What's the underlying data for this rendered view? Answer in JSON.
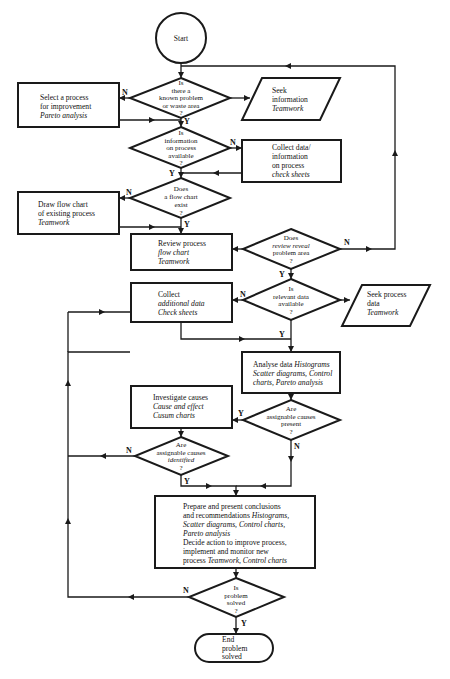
{
  "diagram": {
    "type": "flowchart",
    "nodes": {
      "start": {
        "text": "Start"
      },
      "d1": {
        "l1": "Is",
        "l2": "there a",
        "l3": "known problem",
        "l4": "or waste area",
        "q": "?"
      },
      "select": {
        "l1": "Select a process",
        "l2": "for improvement",
        "tool": "Pareto analysis"
      },
      "seek_info": {
        "l1": "Seek",
        "l2": "information",
        "tool": "Teamwork"
      },
      "d2": {
        "l1": "Is",
        "l2": "information",
        "l3": "on process",
        "l4": "available",
        "q": "?"
      },
      "collect": {
        "l1": "Collect data/",
        "l2": "information",
        "l3": "on process",
        "tool": "check sheets"
      },
      "d3": {
        "l1": "Does",
        "l2": "a flow chart",
        "l3": "exist",
        "q": "?"
      },
      "draw": {
        "l1": "Draw flow chart",
        "l2": "of existing process",
        "tool": "Teamwork"
      },
      "review": {
        "l1": "Review process",
        "l2": "flow chart",
        "tool": "Teamwork"
      },
      "d4": {
        "l1": "Does",
        "l2": "review reveal",
        "l3": "problem area",
        "q": "?"
      },
      "collect_add": {
        "l1": "Collect",
        "l2": "additional data",
        "tool": "Check sheets"
      },
      "d5": {
        "l1": "Is",
        "l2": "relevant data",
        "l3": "available",
        "q": "?"
      },
      "seek_proc": {
        "l1": "Seek process",
        "l2": "data",
        "tool": "Teamwork"
      },
      "analyse": {
        "l1a": "Analyse data ",
        "l1b": "Histograms",
        "l2": "Scatter diagrams, Control",
        "l3": "charts, Pareto analysis"
      },
      "investigate": {
        "l1": "Investigate causes",
        "l2": "Cause and effect",
        "l3": "Cusum charts"
      },
      "d6": {
        "l1": "Are",
        "l2": "assignable causes",
        "l3": "present",
        "q": "?"
      },
      "d7": {
        "l1": "Are",
        "l2": "assignable causes",
        "l3": "identified",
        "q": "?"
      },
      "prepare": {
        "l1": "Prepare and present conclusions",
        "l2a": "and recommendations ",
        "l2b": "Histograms,",
        "l3": "Scatter diagrams, Control charts,",
        "l4": "Pareto analysis",
        "l5": "Decide action to improve process,",
        "l6": "implement and monitor new",
        "l7a": "process ",
        "l7b": "Teamwork, Control charts"
      },
      "d8": {
        "l1": "Is",
        "l2": "problem",
        "l3": "solved",
        "q": "?"
      },
      "end": {
        "l1": "End",
        "l2": "problem",
        "l3": "solved"
      }
    },
    "labels": {
      "yes": "Y",
      "no": "N"
    }
  }
}
